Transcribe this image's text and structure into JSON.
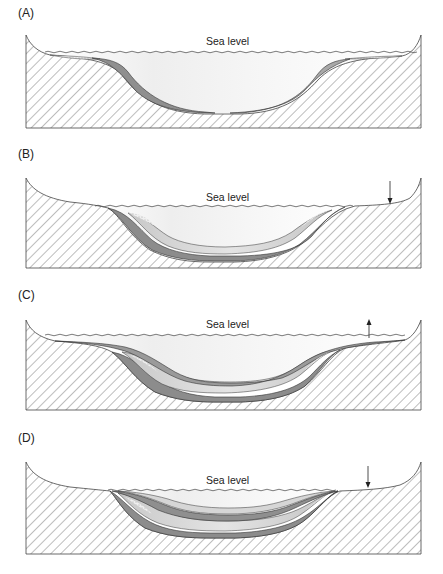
{
  "figure": {
    "panels": [
      {
        "id": "A",
        "label": "(A)",
        "sea_level_label": "Sea level",
        "sea_level_change": "none"
      },
      {
        "id": "B",
        "label": "(B)",
        "sea_level_label": "Sea level",
        "sea_level_change": "fall",
        "arrow": "down-arrow"
      },
      {
        "id": "C",
        "label": "(C)",
        "sea_level_label": "Sea level",
        "sea_level_change": "rise",
        "arrow": "up-arrow"
      },
      {
        "id": "D",
        "label": "(D)",
        "sea_level_label": "Sea level",
        "sea_level_change": "fall",
        "arrow": "down-arrow"
      }
    ],
    "colors": {
      "basement_hatch": "#555555",
      "dark_layer": "#8c8c8c",
      "mid_layer": "#b4b4b4",
      "light_layer": "#d8d8d8",
      "water": "#f0f0f0",
      "outline": "#333333",
      "stipple": "#777777"
    }
  }
}
